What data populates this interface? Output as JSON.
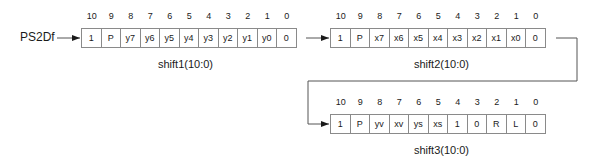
{
  "input_label": "PS2Df",
  "index_labels": [
    "10",
    "9",
    "8",
    "7",
    "6",
    "5",
    "4",
    "3",
    "2",
    "1",
    "0"
  ],
  "registers": [
    {
      "name": "shift1(10:0)",
      "bits": [
        "1",
        "P",
        "y7",
        "y6",
        "y5",
        "y4",
        "y3",
        "y2",
        "y1",
        "y0",
        "0"
      ]
    },
    {
      "name": "shift2(10:0)",
      "bits": [
        "1",
        "P",
        "x7",
        "x6",
        "x5",
        "x4",
        "x3",
        "x2",
        "x1",
        "x0",
        "0"
      ]
    },
    {
      "name": "shift3(10:0)",
      "bits": [
        "1",
        "P",
        "yv",
        "xv",
        "ys",
        "xs",
        "1",
        "0",
        "R",
        "L",
        "0"
      ]
    }
  ],
  "colors": {
    "line": "#555555",
    "border": "#8a8a8a",
    "text": "#1a1a1a"
  }
}
